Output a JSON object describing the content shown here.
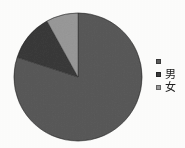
{
  "figure": {
    "background_color": "#fdfdfc",
    "rendering": "grayscale scanned figure"
  },
  "legend": {
    "position": "right",
    "items": [
      {
        "label": "",
        "swatch_color": "#5a5a5a",
        "name": "legend-item-1"
      },
      {
        "label": "男",
        "swatch_color": "#3a3a3a",
        "name": "legend-item-male"
      },
      {
        "label": "女",
        "swatch_color": "#9a9a9a",
        "name": "legend-item-female"
      }
    ]
  },
  "chart_data": {
    "type": "pie",
    "title": "",
    "subtitle": "",
    "xlabel": "",
    "ylabel": "",
    "grid": false,
    "legend_position": "right",
    "start_angle_deg": 0,
    "direction": "clockwise",
    "center": {
      "x": 78,
      "y": 77
    },
    "radius": 64,
    "labels": [
      "",
      "男",
      "女"
    ],
    "values": [
      80,
      12,
      8
    ],
    "units": "percent",
    "colors": [
      "#5a5a5a",
      "#3a3a3a",
      "#9a9a9a"
    ],
    "slices": [
      {
        "label": "",
        "value": 80,
        "percent": 80,
        "color": "#5a5a5a",
        "start_angle_deg": 0,
        "end_angle_deg": 288
      },
      {
        "label": "男",
        "value": 12,
        "percent": 12,
        "color": "#3a3a3a",
        "start_angle_deg": 288,
        "end_angle_deg": 331
      },
      {
        "label": "女",
        "value": 8,
        "percent": 8,
        "color": "#9a9a9a",
        "start_angle_deg": 331,
        "end_angle_deg": 360
      }
    ]
  }
}
